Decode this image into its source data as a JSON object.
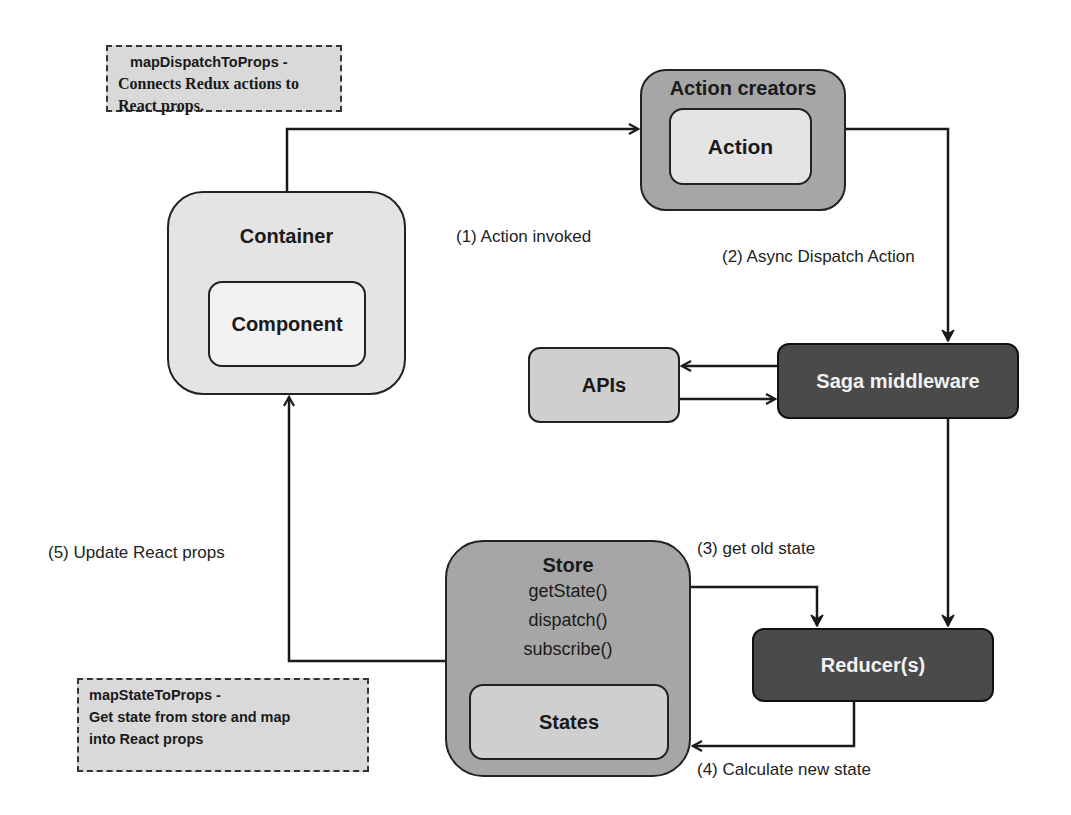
{
  "notes": {
    "map_dispatch": {
      "title": "mapDispatchToProps -",
      "body": "Connects Redux actions to React props."
    },
    "map_state": {
      "title": "mapStateToProps -",
      "line1": "Get state from store and map",
      "line2": "into React props"
    }
  },
  "nodes": {
    "container": {
      "title": "Container",
      "child": "Component"
    },
    "action_creators": {
      "title": "Action creators",
      "child": "Action"
    },
    "apis": {
      "title": "APIs"
    },
    "saga": {
      "title": "Saga middleware"
    },
    "reducer": {
      "title": "Reducer(s)"
    },
    "store": {
      "title": "Store",
      "methods": [
        "getState()",
        "dispatch()",
        "subscribe()"
      ],
      "child": "States"
    }
  },
  "edges": {
    "step1": "(1) Action invoked",
    "step2": "(2) Async Dispatch Action",
    "step3": "(3) get old state",
    "step4": "(4) Calculate new state",
    "step5": "(5) Update React props"
  },
  "colors": {
    "light_fill": "#e4e4e4",
    "mid_fill": "#a6a6a6",
    "dark_fill": "#4a4a4a",
    "note_fill": "#d9d9d9",
    "stroke": "#222222"
  }
}
